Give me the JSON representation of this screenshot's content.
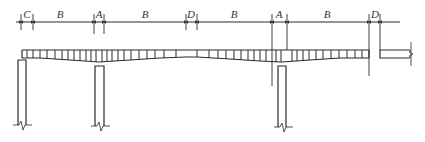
{
  "diagram": {
    "type": "bridge-elevation",
    "colors": {
      "line": "#2a2a2a",
      "thin": "#555555",
      "background": "#ffffff"
    },
    "dimension_line": {
      "y": 22,
      "segments": [
        {
          "label": "C",
          "x1": 21,
          "x2": 33
        },
        {
          "label": "B",
          "x1": 33,
          "x2": 94
        },
        {
          "label": "A",
          "x1": 94,
          "x2": 104
        },
        {
          "label": "B",
          "x1": 104,
          "x2": 186
        },
        {
          "label": "D",
          "x1": 186,
          "x2": 197
        },
        {
          "label": "B",
          "x1": 197,
          "x2": 272
        },
        {
          "label": "A",
          "x1": 272,
          "x2": 287
        },
        {
          "label": "B",
          "x1": 287,
          "x2": 369
        },
        {
          "label": "D",
          "x1": 369,
          "x2": 380
        }
      ]
    },
    "labels": [
      "C",
      "B",
      "A",
      "B",
      "D",
      "B",
      "A",
      "B",
      "D"
    ],
    "piers": [
      {
        "name": "pier-1",
        "x": 18,
        "width": 8,
        "top": 60,
        "bottom": 128
      },
      {
        "name": "pier-2",
        "x": 95,
        "width": 9,
        "top": 66,
        "bottom": 130
      },
      {
        "name": "pier-3",
        "x": 278,
        "width": 8,
        "top": 66,
        "bottom": 130
      }
    ]
  }
}
